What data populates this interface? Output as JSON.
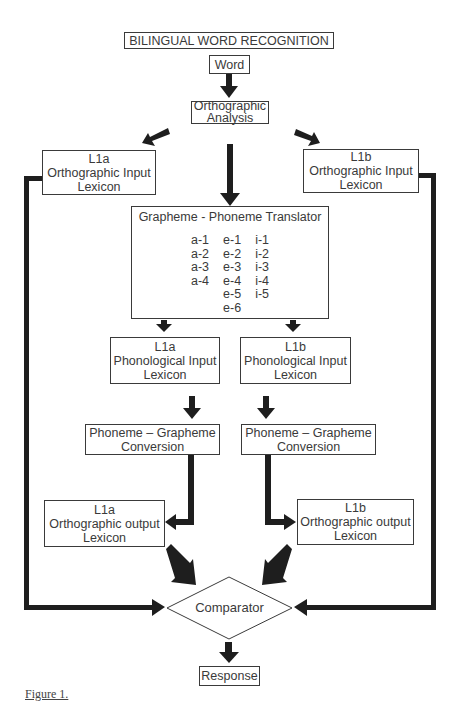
{
  "diagram": {
    "title": "BILINGUAL WORD RECOGNITION",
    "nodes": {
      "word": {
        "label": "Word"
      },
      "orthographic_analysis": {
        "lines": [
          "Orthographic",
          "Analysis"
        ]
      },
      "l1a_orth_input": {
        "lines": [
          "L1a",
          "Orthographic Input",
          "Lexicon"
        ]
      },
      "l1b_orth_input": {
        "lines": [
          "L1b",
          "Orthographic Input",
          "Lexicon"
        ]
      },
      "gpt": {
        "title": "Grapheme - Phoneme Translator",
        "columns": [
          [
            "a-1",
            "a-2",
            "a-3",
            "a-4"
          ],
          [
            "e-1",
            "e-2",
            "e-3",
            "e-4",
            "e-5",
            "e-6"
          ],
          [
            "i-1",
            "i-2",
            "i-3",
            "i-4",
            "i-5"
          ]
        ]
      },
      "l1a_phon_input": {
        "lines": [
          "L1a",
          "Phonological Input",
          "Lexicon"
        ]
      },
      "l1b_phon_input": {
        "lines": [
          "L1b",
          "Phonological Input",
          "Lexicon"
        ]
      },
      "l1a_pgc": {
        "lines": [
          "Phoneme – Grapheme",
          "Conversion"
        ]
      },
      "l1b_pgc": {
        "lines": [
          "Phoneme – Grapheme",
          "Conversion"
        ]
      },
      "l1a_orth_output": {
        "lines": [
          "L1a",
          "Orthographic output",
          "Lexicon"
        ]
      },
      "l1b_orth_output": {
        "lines": [
          "L1b",
          "Orthographic output",
          "Lexicon"
        ]
      },
      "comparator": {
        "label": "Comparator"
      },
      "response": {
        "label": "Response"
      }
    },
    "edges": [
      [
        "word",
        "orthographic_analysis"
      ],
      [
        "orthographic_analysis",
        "l1a_orth_input"
      ],
      [
        "orthographic_analysis",
        "gpt"
      ],
      [
        "orthographic_analysis",
        "l1b_orth_input"
      ],
      [
        "l1a_orth_input",
        "comparator"
      ],
      [
        "l1b_orth_input",
        "comparator"
      ],
      [
        "gpt",
        "l1a_phon_input"
      ],
      [
        "gpt",
        "l1b_phon_input"
      ],
      [
        "l1a_phon_input",
        "l1a_pgc"
      ],
      [
        "l1b_phon_input",
        "l1b_pgc"
      ],
      [
        "l1a_pgc",
        "l1a_orth_output"
      ],
      [
        "l1b_pgc",
        "l1b_orth_output"
      ],
      [
        "l1a_orth_output",
        "comparator"
      ],
      [
        "l1b_orth_output",
        "comparator"
      ],
      [
        "comparator",
        "response"
      ]
    ],
    "caption": "Figure 1."
  }
}
